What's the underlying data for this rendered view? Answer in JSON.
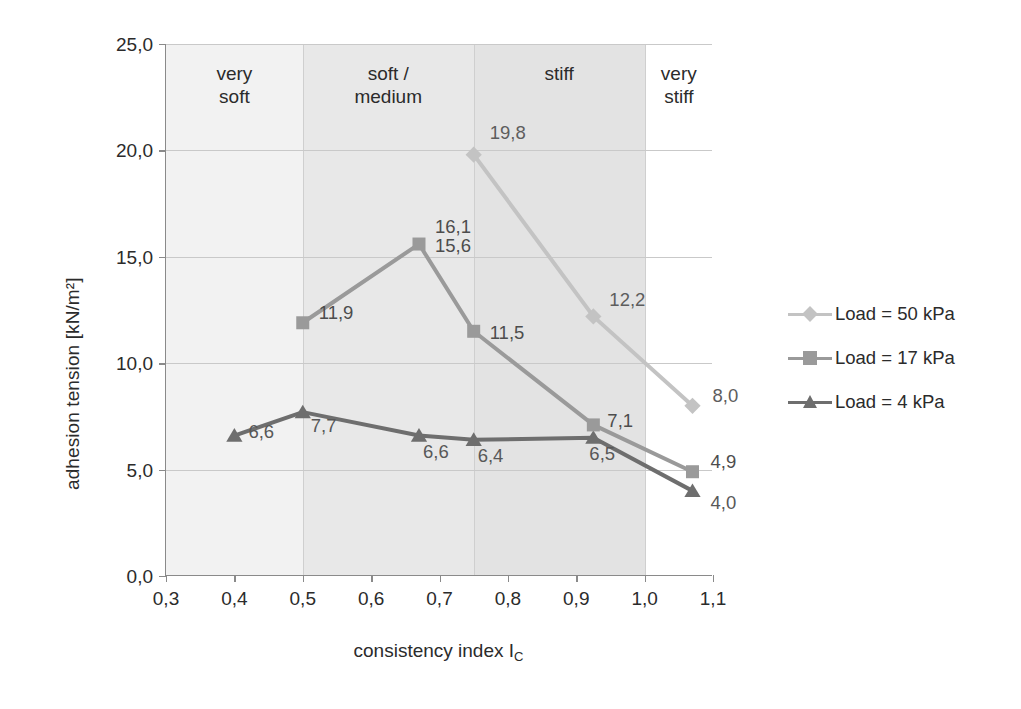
{
  "chart_data": {
    "type": "line",
    "title": "",
    "xlabel": "consistency index I",
    "xlabel_sub": "C",
    "ylabel": "adhesion tension [kN/m²]",
    "xlim": [
      0.3,
      1.1
    ],
    "ylim": [
      0.0,
      25.0
    ],
    "xticks": [
      "0,3",
      "0,4",
      "0,5",
      "0,6",
      "0,7",
      "0,8",
      "0,9",
      "1,0",
      "1,1"
    ],
    "xtick_values": [
      0.3,
      0.4,
      0.5,
      0.6,
      0.7,
      0.8,
      0.9,
      1.0,
      1.1
    ],
    "yticks": [
      "0,0",
      "5,0",
      "10,0",
      "15,0",
      "20,0",
      "25,0"
    ],
    "ytick_values": [
      0,
      5,
      10,
      15,
      20,
      25
    ],
    "grid": "horizontal",
    "legend_position": "right",
    "series": [
      {
        "name": "Load = 50 kPa",
        "marker": "diamond",
        "color": "#c3c3c3",
        "x": [
          0.75,
          0.925,
          1.07
        ],
        "values": [
          19.8,
          12.2,
          8.0
        ],
        "labels": [
          "19,8",
          "12,2",
          "8,0"
        ]
      },
      {
        "name": "Load = 17 kPa",
        "marker": "square",
        "color": "#9a9a9a",
        "x": [
          0.5,
          0.67,
          0.75,
          0.925,
          1.07
        ],
        "values": [
          11.9,
          15.6,
          11.5,
          7.1,
          4.9
        ],
        "labels": [
          "11,9",
          "15,6",
          "11,5",
          "7,1",
          "4,9"
        ]
      },
      {
        "name": "Load = 4 kPa",
        "marker": "triangle",
        "color": "#6e6e6e",
        "x": [
          0.4,
          0.5,
          0.67,
          0.75,
          0.925,
          1.07
        ],
        "values": [
          6.6,
          7.7,
          6.6,
          6.4,
          6.5,
          4.0
        ],
        "labels": [
          "6,6",
          "7,7",
          "6,6",
          "6,4",
          "6,5",
          "4,0"
        ]
      }
    ],
    "extra_annotations": [
      "16,1"
    ],
    "consistency_bands": [
      {
        "label_line1": "very",
        "label_line2": "soft",
        "from": 0.3,
        "to": 0.5,
        "fill": "#f2f2f2"
      },
      {
        "label_line1": "soft /",
        "label_line2": "medium",
        "from": 0.5,
        "to": 0.75,
        "fill": "#e8e8e8"
      },
      {
        "label_line1": "stiff",
        "label_line2": "",
        "from": 0.75,
        "to": 1.0,
        "fill": "#e3e3e3"
      },
      {
        "label_line1": "very",
        "label_line2": "stiff",
        "from": 1.0,
        "to": 1.1,
        "fill": "#ffffff"
      }
    ]
  },
  "legend": {
    "items": [
      {
        "label": "Load = 50 kPa",
        "color": "#c3c3c3",
        "marker": "diamond"
      },
      {
        "label": "Load = 17 kPa",
        "color": "#9a9a9a",
        "marker": "square"
      },
      {
        "label": "Load = 4 kPa",
        "color": "#6e6e6e",
        "marker": "triangle"
      }
    ]
  },
  "colors": {
    "axis": "#8a8a8a",
    "grid": "#c9c9c9",
    "text": "#2b2b2b",
    "series_50kpa": "#c3c3c3",
    "series_17kpa": "#9a9a9a",
    "series_4kpa": "#6e6e6e"
  }
}
